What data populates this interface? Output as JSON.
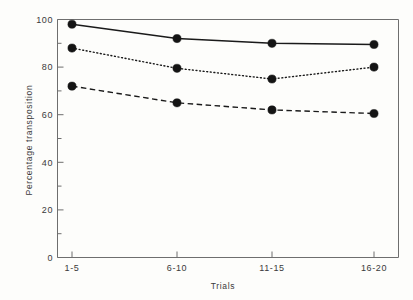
{
  "chart_data": {
    "type": "line",
    "title": "",
    "xlabel": "Trials",
    "ylabel": "Percentage transposition",
    "categories": [
      "1-5",
      "6-10",
      "11-15",
      "16-20"
    ],
    "ylim": [
      0,
      100
    ],
    "y_ticks": [
      0,
      20,
      40,
      60,
      80,
      100
    ],
    "y_tick_labels": [
      "0",
      "20",
      "40",
      "60",
      "80",
      "100"
    ],
    "y_minor_ticks": [
      10,
      30,
      50,
      70,
      90
    ],
    "grid": false,
    "legend": "none",
    "series": [
      {
        "name": "solid-series",
        "style": "solid",
        "marker": "filled-circle",
        "color": "#141414",
        "values": [
          98,
          92,
          90,
          89.5
        ]
      },
      {
        "name": "dotted-series",
        "style": "dotted",
        "marker": "filled-circle",
        "color": "#141414",
        "values": [
          88,
          79.5,
          75,
          80
        ]
      },
      {
        "name": "dashed-series",
        "style": "dashed",
        "marker": "filled-circle",
        "color": "#141414",
        "values": [
          72,
          65,
          62,
          60.5
        ]
      }
    ]
  },
  "axis_labels": {
    "y_title": "Percentage transposition",
    "x_title": "Trials"
  },
  "y_tick_text": {
    "t0": "0",
    "t20": "20",
    "t40": "40",
    "t60": "60",
    "t80": "80",
    "t100": "100"
  },
  "x_tick_text": {
    "c0": "1-5",
    "c1": "6-10",
    "c2": "11-15",
    "c3": "16-20"
  }
}
